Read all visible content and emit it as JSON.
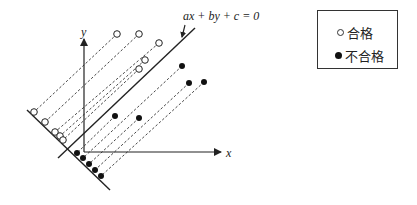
{
  "diagram": {
    "equation_label": "ax + by + c = 0",
    "x_axis_label": "x",
    "y_axis_label": "y",
    "colors": {
      "ink": "#222222",
      "filled_point": "#111111",
      "background": "#ffffff"
    }
  },
  "legend": {
    "items": [
      {
        "symbol": "open-circle",
        "label": "合格"
      },
      {
        "symbol": "filled-circle",
        "label": "不合格"
      }
    ]
  },
  "points": {
    "pass": [
      {
        "x": 117,
        "y": 34,
        "proj_x": 34,
        "proj_y": 112
      },
      {
        "x": 139,
        "y": 34,
        "proj_x": 45,
        "proj_y": 122
      },
      {
        "x": 159,
        "y": 43,
        "proj_x": 55,
        "proj_y": 132
      },
      {
        "x": 145,
        "y": 60,
        "proj_x": 60,
        "proj_y": 136
      },
      {
        "x": 139,
        "y": 69,
        "proj_x": 63,
        "proj_y": 140
      }
    ],
    "fail": [
      {
        "x": 115,
        "y": 116,
        "proj_x": 77,
        "proj_y": 153
      },
      {
        "x": 182,
        "y": 66,
        "proj_x": 83,
        "proj_y": 158
      },
      {
        "x": 139,
        "y": 118,
        "proj_x": 89,
        "proj_y": 164
      },
      {
        "x": 189,
        "y": 83,
        "proj_x": 95,
        "proj_y": 170
      },
      {
        "x": 204,
        "y": 82,
        "proj_x": 101,
        "proj_y": 176
      }
    ]
  }
}
